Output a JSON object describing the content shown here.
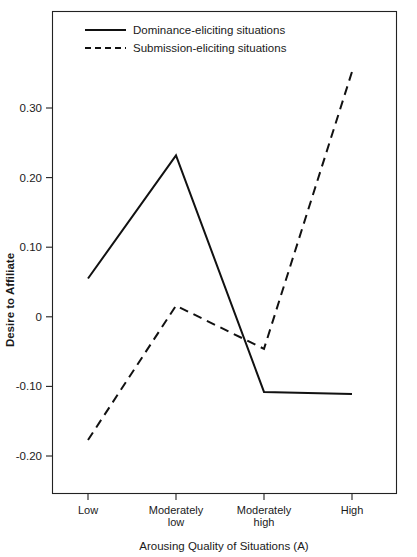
{
  "chart_data": {
    "type": "line",
    "title": "",
    "xlabel": "Arousing Quality of Situations (A)",
    "ylabel": "Desire to Affiliate",
    "categories": [
      "Low",
      "Moderately low",
      "Moderately high",
      "High"
    ],
    "category_lines": [
      [
        "Low",
        ""
      ],
      [
        "Moderately",
        "low"
      ],
      [
        "Moderately",
        "high"
      ],
      [
        "High",
        ""
      ]
    ],
    "ylim": [
      -0.25,
      0.4
    ],
    "yticks": [
      0.3,
      0.2,
      0.1,
      0,
      -0.1,
      -0.2
    ],
    "ytick_labels": [
      "0.30",
      "0.20",
      "0.10",
      "0",
      "-0.10",
      "-0.20"
    ],
    "grid": false,
    "legend_position": "top-left-inside",
    "series": [
      {
        "name": "Dominance-eliciting situations",
        "style": "solid",
        "values": [
          0.055,
          0.232,
          -0.108,
          -0.111
        ]
      },
      {
        "name": "Submission-eliciting situations",
        "style": "dashed",
        "values": [
          -0.177,
          0.016,
          -0.046,
          0.352
        ]
      }
    ]
  },
  "legend": {
    "items": [
      {
        "label": "Dominance-eliciting situations",
        "style": "solid"
      },
      {
        "label": "Submission-eliciting situations",
        "style": "dashed"
      }
    ]
  },
  "axes": {
    "y_title": "Desire to Affiliate",
    "x_title": "Arousing Quality of Situations (A)",
    "y_labels": [
      "0.30",
      "0.20",
      "0.10",
      "0",
      "-0.10",
      "-0.20"
    ],
    "x_labels_line1": [
      "Low",
      "Moderately",
      "Moderately",
      "High"
    ],
    "x_labels_line2": [
      "",
      "low",
      "high",
      ""
    ]
  },
  "colors": {
    "line": "#111111",
    "axis": "#222222",
    "background": "#ffffff",
    "text": "#1a1a1a"
  }
}
